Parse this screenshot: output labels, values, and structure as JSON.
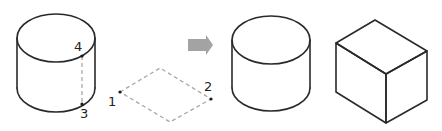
{
  "diagram": {
    "labels": {
      "point_1": "1",
      "point_2": "2",
      "point_3": "3",
      "point_4": "4"
    },
    "colors": {
      "outline": "#2a2a2a",
      "dashed_guide": "#a8a8a8",
      "arrow": "#a3a3a3",
      "background": "#ffffff"
    },
    "shapes": [
      {
        "id": "cylinder-with-points",
        "type": "cylinder",
        "points": [
          "4",
          "3"
        ]
      },
      {
        "id": "dashed-rhombus",
        "type": "rhombus",
        "style": "dashed",
        "points": [
          "1",
          "2"
        ]
      },
      {
        "id": "arrow",
        "type": "arrow-right"
      },
      {
        "id": "cylinder-result",
        "type": "cylinder"
      },
      {
        "id": "cube-result",
        "type": "cube"
      }
    ]
  }
}
